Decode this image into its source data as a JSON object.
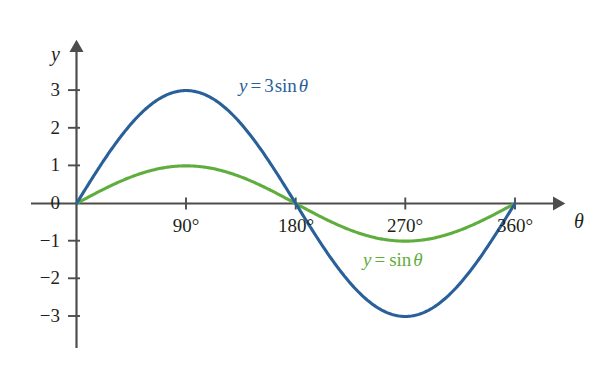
{
  "chart_data": {
    "type": "line",
    "title": "",
    "xlabel": "θ",
    "ylabel": "y",
    "xlim": [
      -40,
      400
    ],
    "ylim": [
      -3.8,
      3.9
    ],
    "grid": false,
    "legend_position": "inline-annotations",
    "x_ticks": [
      {
        "value": 90,
        "label": "90°"
      },
      {
        "value": 180,
        "label": "180°"
      },
      {
        "value": 270,
        "label": "270°"
      },
      {
        "value": 360,
        "label": "360°"
      }
    ],
    "y_ticks": [
      {
        "value": 3,
        "label": "3"
      },
      {
        "value": 2,
        "label": "2"
      },
      {
        "value": 1,
        "label": "1"
      },
      {
        "value": 0,
        "label": "0"
      },
      {
        "value": -1,
        "label": "−1"
      },
      {
        "value": -2,
        "label": "−2"
      },
      {
        "value": -3,
        "label": "−3"
      }
    ],
    "series": [
      {
        "name": "y = 3 sin θ",
        "color": "#2a6099",
        "amplitude": 3,
        "x": [
          0,
          15,
          30,
          45,
          60,
          75,
          90,
          105,
          120,
          135,
          150,
          165,
          180,
          195,
          210,
          225,
          240,
          255,
          270,
          285,
          300,
          315,
          330,
          345,
          360
        ],
        "values": [
          0,
          0.776,
          1.5,
          2.121,
          2.598,
          2.898,
          3,
          2.898,
          2.598,
          2.121,
          1.5,
          0.776,
          0,
          -0.776,
          -1.5,
          -2.121,
          -2.598,
          -2.898,
          -3,
          -2.898,
          -2.598,
          -2.121,
          -1.5,
          -0.776,
          0
        ]
      },
      {
        "name": "y = sin θ",
        "color": "#5fae3d",
        "amplitude": 1,
        "x": [
          0,
          15,
          30,
          45,
          60,
          75,
          90,
          105,
          120,
          135,
          150,
          165,
          180,
          195,
          210,
          225,
          240,
          255,
          270,
          285,
          300,
          315,
          330,
          345,
          360
        ],
        "values": [
          0,
          0.259,
          0.5,
          0.707,
          0.866,
          0.966,
          1,
          0.966,
          0.866,
          0.707,
          0.5,
          0.259,
          0,
          -0.259,
          -0.5,
          -0.707,
          -0.866,
          -0.966,
          -1,
          -0.966,
          -0.866,
          -0.707,
          -0.5,
          -0.259,
          0
        ]
      }
    ]
  },
  "annotations": {
    "blue_label": {
      "var": "y",
      "op": "=",
      "coefficient": "3",
      "function": "sin",
      "argument": "θ",
      "full": "y = 3 sin θ",
      "color": "#2a6099"
    },
    "green_label": {
      "var": "y",
      "op": "=",
      "coefficient": "",
      "function": "sin",
      "argument": "θ",
      "full": "y = sin θ",
      "color": "#5fae3d"
    }
  },
  "axes": {
    "y_axis_name": "y",
    "x_axis_name": "θ",
    "axis_color": "#4d4d4f"
  }
}
